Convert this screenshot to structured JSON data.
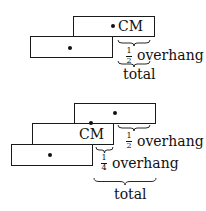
{
  "figure_top": {
    "blocks": [
      {
        "id": "top",
        "has_dot": true
      },
      {
        "id": "bottom",
        "has_dot": true
      }
    ],
    "cm_label": "CM",
    "half_overhang": {
      "numerator": "1",
      "denominator": "2",
      "label": "overhang"
    },
    "total_label": "total"
  },
  "figure_bottom": {
    "blocks": [
      {
        "id": "top",
        "has_dot": true
      },
      {
        "id": "middle",
        "has_dot": false
      },
      {
        "id": "bottom",
        "has_dot": true
      }
    ],
    "cm_label": "CM",
    "half_overhang": {
      "numerator": "1",
      "denominator": "2",
      "label": "overhang"
    },
    "quarter_overhang": {
      "numerator": "1",
      "denominator": "4",
      "label": "overhang"
    },
    "total_label": "total"
  },
  "colors": {
    "stroke": "#1a1a1a",
    "background": "#ffffff"
  }
}
